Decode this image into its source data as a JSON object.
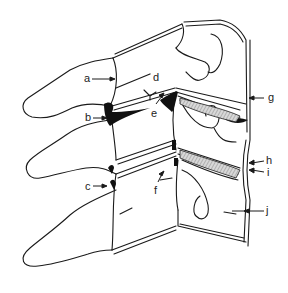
{
  "diagram": {
    "type": "anatomical line drawing",
    "labels": [
      {
        "id": "a",
        "text": "a",
        "x": 84,
        "y": 73
      },
      {
        "id": "b",
        "text": "b",
        "x": 85,
        "y": 112
      },
      {
        "id": "c",
        "text": "c",
        "x": 85,
        "y": 181
      },
      {
        "id": "d",
        "text": "d",
        "x": 153,
        "y": 72
      },
      {
        "id": "e",
        "text": "e",
        "x": 151,
        "y": 108
      },
      {
        "id": "f",
        "text": "f",
        "x": 154,
        "y": 185
      },
      {
        "id": "g",
        "text": "g",
        "x": 268,
        "y": 92
      },
      {
        "id": "h",
        "text": "h",
        "x": 266,
        "y": 155
      },
      {
        "id": "i",
        "text": "i",
        "x": 267,
        "y": 167
      },
      {
        "id": "j",
        "text": "j",
        "x": 266,
        "y": 205
      }
    ],
    "colors": {
      "line": "#1a1a1a",
      "fill_dark": "#111111",
      "hatch": "#999999",
      "background": "#ffffff"
    }
  }
}
